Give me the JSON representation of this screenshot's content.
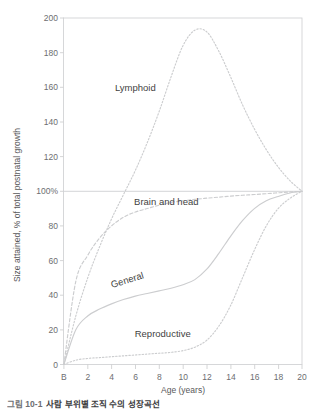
{
  "chart_data": {
    "type": "line",
    "title": "",
    "subtitle": "",
    "xlabel": "Age (years)",
    "ylabel": "Size attained, % of total postnatal growth",
    "xlim": [
      0,
      20
    ],
    "ylim": [
      0,
      200
    ],
    "grid": false,
    "reference_line": {
      "value": 100,
      "label": "100%"
    },
    "legend_position": "inline-annotations",
    "x_ticks": [
      "B",
      "2",
      "4",
      "6",
      "8",
      "10",
      "12",
      "14",
      "16",
      "18",
      "20"
    ],
    "x_tick_values": [
      0,
      2,
      4,
      6,
      8,
      10,
      12,
      14,
      16,
      18,
      20
    ],
    "y_ticks": [
      "0",
      "20",
      "40",
      "60",
      "80",
      "100%",
      "120",
      "140",
      "160",
      "180",
      "200"
    ],
    "y_tick_values": [
      0,
      20,
      40,
      60,
      80,
      100,
      120,
      140,
      160,
      180,
      200
    ],
    "x": [
      0,
      1,
      2,
      3,
      4,
      5,
      6,
      7,
      8,
      9,
      10,
      11,
      12,
      13,
      14,
      15,
      16,
      17,
      18,
      19,
      20
    ],
    "series": [
      {
        "name": "Lymphoid",
        "label": "Lymphoid",
        "style": "dotted",
        "label_x": 6.0,
        "label_y": 158,
        "values": [
          0,
          28,
          50,
          68,
          84,
          98,
          112,
          128,
          146,
          166,
          184,
          193,
          192,
          181,
          166,
          150,
          136,
          124,
          114,
          106,
          100
        ]
      },
      {
        "name": "Brain and head",
        "label": "Brain and head",
        "style": "dashed",
        "label_x": 8.6,
        "label_y": 92,
        "values": [
          0,
          48,
          63,
          73,
          80,
          85,
          88,
          90,
          92,
          93.5,
          94.5,
          95.3,
          96,
          96.6,
          97.2,
          97.7,
          98.1,
          98.6,
          99.1,
          99.6,
          100
        ]
      },
      {
        "name": "General",
        "label": "General",
        "style": "solid",
        "label_x": 5.4,
        "label_y": 47,
        "values": [
          0,
          20,
          28,
          32,
          35,
          37.5,
          39.5,
          41,
          42.5,
          44,
          46,
          49,
          55,
          64,
          74,
          83,
          90,
          94.5,
          97,
          99,
          100
        ]
      },
      {
        "name": "Reproductive",
        "label": "Reproductive",
        "style": "dotted",
        "label_x": 8.3,
        "label_y": 16,
        "values": [
          0,
          2.5,
          3.5,
          4,
          4.5,
          5,
          5.5,
          6,
          6.5,
          7,
          8,
          10,
          14,
          22,
          34,
          50,
          66,
          80,
          90,
          96,
          100
        ]
      }
    ]
  },
  "caption": {
    "number": "그림 10-1",
    "text": "사람 부위별 조직 수의 성장곡선"
  }
}
